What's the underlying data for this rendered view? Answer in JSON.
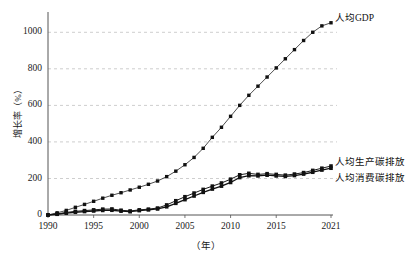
{
  "figure": {
    "faint_top_text": "",
    "axes": {
      "ylabel": "增长率（%）",
      "xlabel": "（年）",
      "yticks": [
        "0",
        "200",
        "400",
        "600",
        "800",
        "1000"
      ],
      "xticks": [
        "1990",
        "1995",
        "2000",
        "2005",
        "2010",
        "2015",
        "2021"
      ]
    },
    "series_labels": {
      "gdp": "人均GDP",
      "production": "人均生产碳排放",
      "consumption": "人均消费碳排放"
    }
  },
  "chart_data": {
    "type": "line",
    "title": "",
    "xlabel": "（年）",
    "ylabel": "增长率（%）",
    "xlim": [
      1990,
      2021
    ],
    "ylim": [
      0,
      1100
    ],
    "yticks": [
      0,
      200,
      400,
      600,
      800,
      1000
    ],
    "xticks": [
      1990,
      1995,
      2000,
      2005,
      2010,
      2015,
      2021
    ],
    "grid": "horizontal-dashed",
    "legend": "inline-right-of-line-ends",
    "x": [
      1990,
      1991,
      1992,
      1993,
      1994,
      1995,
      1996,
      1997,
      1998,
      1999,
      2000,
      2001,
      2002,
      2003,
      2004,
      2005,
      2006,
      2007,
      2008,
      2009,
      2010,
      2011,
      2012,
      2013,
      2014,
      2015,
      2016,
      2017,
      2018,
      2019,
      2020,
      2021
    ],
    "series": [
      {
        "name": "人均GDP",
        "marker": "square",
        "values": [
          0,
          12,
          25,
          42,
          58,
          75,
          92,
          108,
          122,
          137,
          152,
          168,
          186,
          210,
          240,
          275,
          315,
          365,
          425,
          480,
          540,
          600,
          655,
          705,
          755,
          805,
          855,
          905,
          955,
          1000,
          1035,
          1052
        ]
      },
      {
        "name": "人均生产碳排放",
        "marker": "square",
        "values": [
          0,
          6,
          14,
          20,
          24,
          28,
          32,
          33,
          26,
          22,
          28,
          32,
          38,
          55,
          78,
          100,
          120,
          140,
          158,
          175,
          196,
          220,
          228,
          222,
          226,
          222,
          218,
          224,
          232,
          244,
          256,
          268
        ]
      },
      {
        "name": "人均消费碳排放",
        "marker": "square",
        "values": [
          0,
          4,
          10,
          15,
          19,
          22,
          25,
          26,
          21,
          18,
          24,
          28,
          33,
          45,
          64,
          84,
          104,
          124,
          142,
          158,
          178,
          205,
          215,
          214,
          218,
          214,
          211,
          216,
          224,
          234,
          246,
          256
        ]
      }
    ]
  }
}
